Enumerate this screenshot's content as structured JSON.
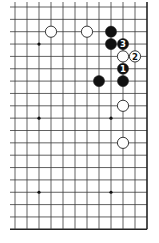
{
  "diagram": {
    "type": "go-board-partial",
    "grid": {
      "columns": 12,
      "rows": 19,
      "origin_x": 15,
      "origin_y": 7,
      "spacing_x": 12,
      "spacing_y": 12.35,
      "left_extend_to": 10,
      "right_border": true,
      "bottom_border": true,
      "line_color": "#3a3a3a",
      "border_color": "#222222"
    },
    "star_points": [
      {
        "col": 2,
        "row": 3
      },
      {
        "col": 2,
        "row": 9
      },
      {
        "col": 8,
        "row": 9
      },
      {
        "col": 2,
        "row": 15
      },
      {
        "col": 8,
        "row": 15
      }
    ],
    "stones": [
      {
        "color": "white",
        "col": 3,
        "row": 2,
        "label": ""
      },
      {
        "color": "white",
        "col": 6,
        "row": 2,
        "label": ""
      },
      {
        "color": "black",
        "col": 8,
        "row": 2,
        "label": ""
      },
      {
        "color": "black",
        "col": 8,
        "row": 3,
        "label": ""
      },
      {
        "color": "black",
        "col": 9,
        "row": 3,
        "label": "3"
      },
      {
        "color": "white",
        "col": 9,
        "row": 4,
        "label": ""
      },
      {
        "color": "white",
        "col": 10,
        "row": 4,
        "label": "2"
      },
      {
        "color": "black",
        "col": 9,
        "row": 5,
        "label": "1"
      },
      {
        "color": "black",
        "col": 9,
        "row": 6,
        "label": ""
      },
      {
        "color": "black",
        "col": 7,
        "row": 6,
        "label": ""
      },
      {
        "color": "white",
        "col": 9,
        "row": 8,
        "label": ""
      },
      {
        "color": "white",
        "col": 9,
        "row": 11,
        "label": ""
      }
    ],
    "colors": {
      "black_stone": "#111111",
      "white_stone": "#ffffff",
      "white_stone_edge": "#222222",
      "label_on_black": "#ffffff",
      "label_on_white": "#111111"
    }
  }
}
